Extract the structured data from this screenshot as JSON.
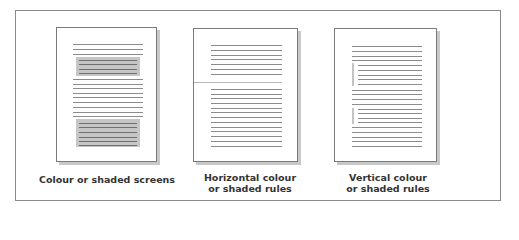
{
  "figure": {
    "panels": [
      {
        "id": "screens",
        "caption_line1": "Colour or shaded screens",
        "caption_line2": ""
      },
      {
        "id": "horizontal",
        "caption_line1": "Horizontal colour",
        "caption_line2": "or shaded rules"
      },
      {
        "id": "vertical",
        "caption_line1": "Vertical colour",
        "caption_line2": "or shaded rules"
      }
    ]
  },
  "colors": {
    "frame_border": "#8a8a8a",
    "page_border": "#7a7a7a",
    "page_shadow": "#c8c8c8",
    "text_line": "#8c8c8c",
    "shade_fill": "#c6c6c6",
    "accent_rule": "#b8b8b8",
    "caption_text": "#333333"
  }
}
